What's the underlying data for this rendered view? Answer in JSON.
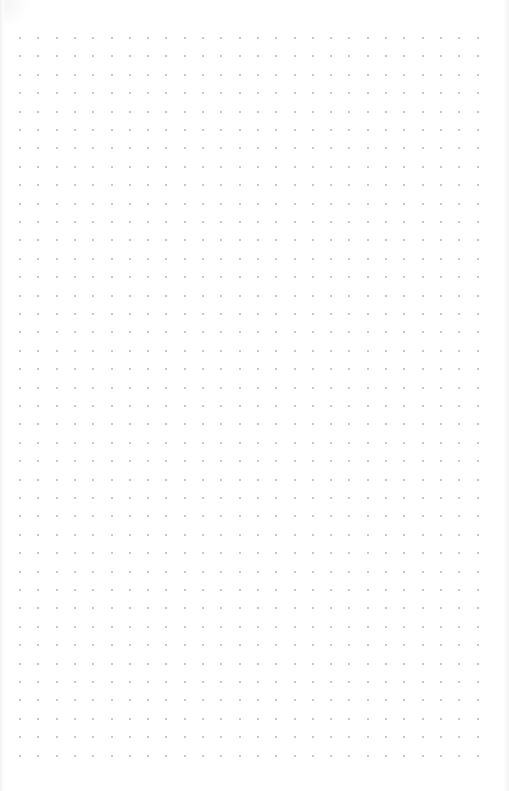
{
  "page": {
    "type": "dot-grid-notebook-page",
    "background_color": "#ffffff",
    "dot_color": "#b4b4b4"
  },
  "grid": {
    "columns": 26,
    "rows": 40,
    "origin_x": 20,
    "origin_y": 38,
    "spacing_x": 18.3,
    "spacing_y": 18.4,
    "dot_size": 2
  }
}
